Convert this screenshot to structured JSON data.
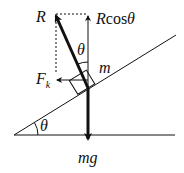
{
  "diagram": {
    "labels": {
      "R": "R",
      "Rcos": "R",
      "cos": "cos",
      "theta_top": "θ",
      "theta_cos": "θ",
      "m": "m",
      "F": "F",
      "k": "k",
      "theta_base": "θ",
      "mg": "mg"
    },
    "colors": {
      "line": "#111111",
      "background": "#ffffff"
    }
  }
}
